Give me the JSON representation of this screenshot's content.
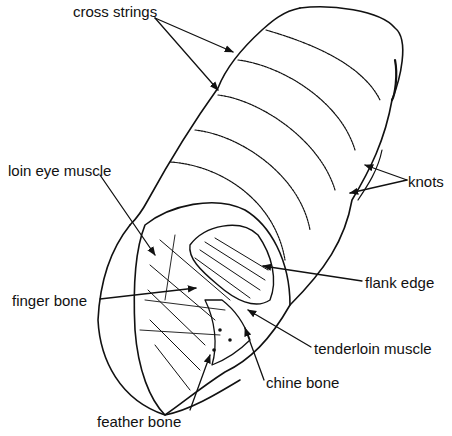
{
  "diagram": {
    "ink_color": "#111111",
    "background": "#ffffff",
    "labels": [
      {
        "id": "cross-strings",
        "text": "cross strings",
        "x": 73,
        "y": 4
      },
      {
        "id": "knots",
        "text": "knots",
        "x": 408,
        "y": 174
      },
      {
        "id": "loin-eye-muscle",
        "text": "loin eye muscle",
        "x": 8,
        "y": 163
      },
      {
        "id": "flank-edge",
        "text": "flank edge",
        "x": 365,
        "y": 275
      },
      {
        "id": "finger-bone",
        "text": "finger bone",
        "x": 12,
        "y": 293
      },
      {
        "id": "tenderloin-muscle",
        "text": "tenderloin muscle",
        "x": 314,
        "y": 341
      },
      {
        "id": "chine-bone",
        "text": "chine bone",
        "x": 266,
        "y": 375
      },
      {
        "id": "feather-bone",
        "text": "feather bone",
        "x": 97,
        "y": 414
      }
    ]
  }
}
